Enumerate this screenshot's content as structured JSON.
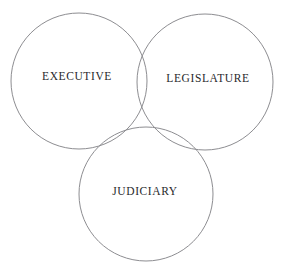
{
  "diagram": {
    "type": "venn-three-circle",
    "background_color": "#ffffff",
    "stroke_color": "#8d8d91",
    "text_color": "#29292c",
    "circles": [
      {
        "id": "executive",
        "label": "EXECUTIVE",
        "cx": 79,
        "cy": 81,
        "r": 68,
        "label_x": 77,
        "label_y": 77
      },
      {
        "id": "legislature",
        "label": "LEGISLATURE",
        "cx": 205,
        "cy": 82,
        "r": 68,
        "label_x": 208,
        "label_y": 79
      },
      {
        "id": "judiciary",
        "label": "JUDICIARY",
        "cx": 146,
        "cy": 194,
        "r": 67,
        "label_x": 145,
        "label_y": 192
      }
    ]
  }
}
